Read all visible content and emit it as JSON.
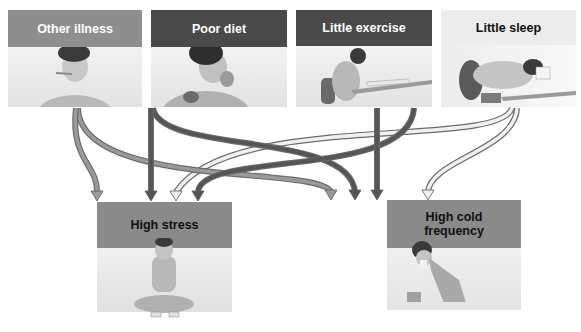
{
  "diagram": {
    "causes": [
      {
        "id": "other-illness",
        "label": "Other illness",
        "header_color": "#8e8e8e",
        "text_color": "#ffffff",
        "illustration": "person with thermometer in mouth"
      },
      {
        "id": "poor-diet",
        "label": "Poor diet",
        "header_color": "#4a4a4a",
        "text_color": "#ffffff",
        "illustration": "person eating"
      },
      {
        "id": "little-exercise",
        "label": "Little exercise",
        "header_color": "#4a4a4a",
        "text_color": "#ffffff",
        "illustration": "person sitting at desk writing"
      },
      {
        "id": "little-sleep",
        "label": "Little sleep",
        "header_color": "#ececec",
        "text_color": "#111111",
        "illustration": "person asleep on desk"
      }
    ],
    "outcomes": [
      {
        "id": "high-stress",
        "label": "High stress",
        "header_color": "#8a8a8a",
        "text_color": "#111111",
        "illustration": "person sitting cross-legged holding head"
      },
      {
        "id": "high-cold-frequency",
        "label": "High cold frequency",
        "label_lines": [
          "High cold",
          "frequency"
        ],
        "header_color": "#8a8a8a",
        "text_color": "#111111",
        "illustration": "person sneezing into tissue"
      }
    ],
    "arrows": [
      {
        "from": "other-illness",
        "to": "high-stress",
        "shade": "medium"
      },
      {
        "from": "other-illness",
        "to": "high-cold-frequency",
        "shade": "medium"
      },
      {
        "from": "poor-diet",
        "to": "high-stress",
        "shade": "dark"
      },
      {
        "from": "poor-diet",
        "to": "high-cold-frequency",
        "shade": "dark"
      },
      {
        "from": "little-exercise",
        "to": "high-stress",
        "shade": "dark"
      },
      {
        "from": "little-exercise",
        "to": "high-cold-frequency",
        "shade": "dark"
      },
      {
        "from": "little-sleep",
        "to": "high-stress",
        "shade": "light"
      },
      {
        "from": "little-sleep",
        "to": "high-cold-frequency",
        "shade": "light"
      }
    ],
    "arrow_colors": {
      "medium": "#9a9a9a",
      "dark": "#555555",
      "light": "#f0f0f0",
      "outline": "#6a6a6a"
    }
  }
}
